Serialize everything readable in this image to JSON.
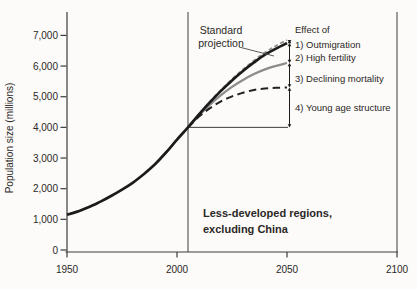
{
  "chart_data": {
    "type": "line",
    "title": "",
    "xlabel": "",
    "ylabel": "Population size (millions)",
    "xlim": [
      1950,
      2100
    ],
    "ylim": [
      0,
      7000
    ],
    "grid": false,
    "legend_position": "none",
    "x_ticks": {
      "values": [
        1950,
        2000,
        2050,
        2100
      ],
      "labels": [
        "1950",
        "2000",
        "2050",
        "2100"
      ]
    },
    "y_ticks": {
      "values": [
        0,
        1000,
        2000,
        3000,
        4000,
        5000,
        6000,
        7000
      ],
      "labels": [
        "0",
        "1,000",
        "2,000",
        "3,000",
        "4,000",
        "5,000",
        "6,000",
        "7,000"
      ]
    },
    "divergence_year": 2005,
    "projection_end_year": 2050,
    "standard_label": [
      "Standard",
      "projection"
    ],
    "effects_header": "Effect of",
    "region_note": [
      "Less-developed regions,",
      "excluding China"
    ],
    "momentum_baseline": {
      "value": 4000,
      "from_year": 2005,
      "to_year": 2050
    },
    "effect_arrows": [
      {
        "label": "1) Outmigration",
        "from": 6750,
        "to": 6850
      },
      {
        "label": "2) High fertility",
        "from": 6100,
        "to": 6750
      },
      {
        "label": "3) Declining mortality",
        "from": 5300,
        "to": 6100
      },
      {
        "label": "4) Young age structure",
        "from": 4000,
        "to": 5300
      }
    ],
    "series": [
      {
        "name": "no-outmigration-projection",
        "style": "short-dash",
        "color": "#8f8f8f",
        "width": 1.8,
        "dash": "4,2.6",
        "points": [
          [
            2005,
            4000
          ],
          [
            2010,
            4430
          ],
          [
            2015,
            4840
          ],
          [
            2020,
            5220
          ],
          [
            2025,
            5570
          ],
          [
            2030,
            5890
          ],
          [
            2035,
            6180
          ],
          [
            2040,
            6440
          ],
          [
            2045,
            6660
          ],
          [
            2050,
            6850
          ]
        ]
      },
      {
        "name": "replacement-fertility-projection",
        "style": "solid",
        "color": "#8c8c8c",
        "width": 2.3,
        "dash": "",
        "points": [
          [
            2005,
            4000
          ],
          [
            2010,
            4390
          ],
          [
            2015,
            4740
          ],
          [
            2020,
            5050
          ],
          [
            2025,
            5320
          ],
          [
            2030,
            5550
          ],
          [
            2035,
            5740
          ],
          [
            2040,
            5890
          ],
          [
            2045,
            6010
          ],
          [
            2050,
            6100
          ]
        ]
      },
      {
        "name": "constant-mortality-projection",
        "style": "long-dash",
        "color": "#222222",
        "width": 2,
        "dash": "7.5,4.5",
        "points": [
          [
            2005,
            4000
          ],
          [
            2010,
            4350
          ],
          [
            2015,
            4630
          ],
          [
            2020,
            4850
          ],
          [
            2025,
            5010
          ],
          [
            2030,
            5130
          ],
          [
            2035,
            5220
          ],
          [
            2040,
            5270
          ],
          [
            2045,
            5290
          ],
          [
            2050,
            5300
          ]
        ]
      },
      {
        "name": "standard-projection",
        "style": "solid",
        "color": "#1b1b1b",
        "width": 2.7,
        "dash": "",
        "points": [
          [
            1950,
            1150
          ],
          [
            1955,
            1260
          ],
          [
            1960,
            1400
          ],
          [
            1965,
            1570
          ],
          [
            1970,
            1760
          ],
          [
            1975,
            1970
          ],
          [
            1980,
            2200
          ],
          [
            1985,
            2480
          ],
          [
            1990,
            2800
          ],
          [
            1995,
            3180
          ],
          [
            2000,
            3600
          ],
          [
            2005,
            4000
          ],
          [
            2010,
            4420
          ],
          [
            2015,
            4820
          ],
          [
            2020,
            5190
          ],
          [
            2025,
            5530
          ],
          [
            2030,
            5840
          ],
          [
            2035,
            6120
          ],
          [
            2040,
            6370
          ],
          [
            2045,
            6570
          ],
          [
            2050,
            6750
          ]
        ]
      }
    ]
  }
}
